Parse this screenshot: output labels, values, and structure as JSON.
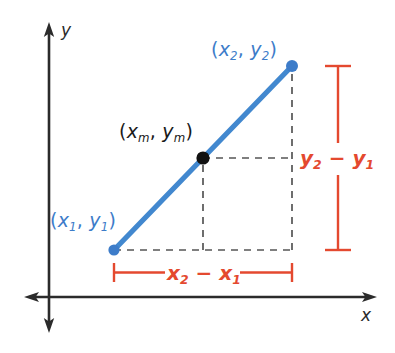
{
  "figure": {
    "axes": {
      "x_label": "x",
      "y_label": "y",
      "axis_color": "#2b2b2b",
      "origin": {
        "x": 49,
        "y": 297
      }
    },
    "colors": {
      "point_blue": "#3d7cc9",
      "segment_blue": "#4288cf",
      "measure_red": "#e4492f",
      "midpoint_black": "#111111",
      "dashed_gray": "#555555",
      "axis": "#2b2b2b"
    },
    "points": [
      {
        "name": "point-1",
        "label_open": "(",
        "label_x": "x",
        "label_x_sub": "1",
        "label_comma": ",",
        "label_y": "y",
        "label_y_sub": "1",
        "label_close": ")",
        "color": "#3d7cc9",
        "px": 114,
        "py": 250
      },
      {
        "name": "midpoint",
        "label_open": "(",
        "label_x": "x",
        "label_x_sub": "m",
        "label_comma": ",",
        "label_y": "y",
        "label_y_sub": "m",
        "label_close": ")",
        "color": "#111111",
        "px": 203,
        "py": 158
      },
      {
        "name": "point-2",
        "label_open": "(",
        "label_x": "x",
        "label_x_sub": "2",
        "label_comma": ",",
        "label_y": "y",
        "label_y_sub": "2",
        "label_close": ")",
        "color": "#3d7cc9",
        "px": 292,
        "py": 66
      }
    ],
    "measures": [
      {
        "name": "horizontal-run",
        "a": "x",
        "a_sub": "2",
        "op": "−",
        "b": "x",
        "b_sub": "1",
        "orientation": "horizontal",
        "from": 114,
        "to": 292,
        "at": 272
      },
      {
        "name": "vertical-rise",
        "a": "y",
        "a_sub": "2",
        "op": "−",
        "b": "y",
        "b_sub": "1",
        "orientation": "vertical",
        "from": 66,
        "to": 250,
        "at": 338
      }
    ]
  }
}
